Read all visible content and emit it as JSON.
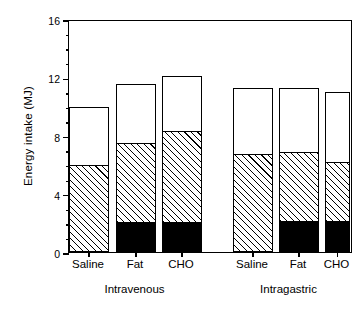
{
  "chart_data": {
    "type": "bar",
    "title": "",
    "subtitle": "",
    "xlabel": "",
    "ylabel": "Energy intake  (MJ)",
    "ylim": [
      0,
      16
    ],
    "ytick_labels": [
      "0",
      "4",
      "8",
      "12",
      "16"
    ],
    "ytick_values": [
      0,
      4,
      8,
      12,
      16
    ],
    "yminor_step": 1,
    "grid": false,
    "legend": "none",
    "stacked": true,
    "series": [
      {
        "name": "black-segment",
        "fill": "solid-black",
        "values": [
          0.0,
          2.05,
          2.05,
          0.0,
          2.1,
          2.1
        ]
      },
      {
        "name": "hatched-segment",
        "fill": "diagonal-hatch",
        "values": [
          5.98,
          5.45,
          6.25,
          6.7,
          4.75,
          4.1
        ]
      },
      {
        "name": "open-segment",
        "fill": "white",
        "values": [
          3.98,
          4.05,
          3.8,
          4.55,
          4.4,
          4.8
        ]
      }
    ],
    "cumulative_tops": {
      "black_top": [
        0.0,
        2.05,
        2.05,
        0.0,
        2.1,
        2.1
      ],
      "hatched_top": [
        5.98,
        7.5,
        8.3,
        6.7,
        6.85,
        6.2
      ],
      "bar_total": [
        9.96,
        11.55,
        12.1,
        11.25,
        11.25,
        11.0
      ]
    },
    "categories": [
      "Saline",
      "Fat",
      "CHO",
      "Saline",
      "Fat",
      "CHO"
    ],
    "groups": [
      {
        "label": "Intravenous",
        "categories": [
          "Saline",
          "Fat",
          "CHO"
        ]
      },
      {
        "label": "Intragastric",
        "categories": [
          "Saline",
          "Fat",
          "CHO"
        ]
      }
    ]
  },
  "axis": {
    "y_title": "Energy intake  (MJ)",
    "ticks": [
      {
        "label": "16",
        "value": 16,
        "major": true
      },
      {
        "label": "",
        "value": 15,
        "major": false
      },
      {
        "label": "",
        "value": 14,
        "major": false
      },
      {
        "label": "",
        "value": 13,
        "major": false
      },
      {
        "label": "12",
        "value": 12,
        "major": true
      },
      {
        "label": "",
        "value": 11,
        "major": false
      },
      {
        "label": "",
        "value": 10,
        "major": false
      },
      {
        "label": "",
        "value": 9,
        "major": false
      },
      {
        "label": "8",
        "value": 8,
        "major": true
      },
      {
        "label": "",
        "value": 7,
        "major": false
      },
      {
        "label": "",
        "value": 6,
        "major": false
      },
      {
        "label": "",
        "value": 5,
        "major": false
      },
      {
        "label": "4",
        "value": 4,
        "major": true
      },
      {
        "label": "",
        "value": 3,
        "major": false
      },
      {
        "label": "",
        "value": 2,
        "major": false
      },
      {
        "label": "",
        "value": 1,
        "major": false
      },
      {
        "label": "0",
        "value": 0,
        "major": true
      }
    ]
  },
  "bars": [
    {
      "cat": "Saline",
      "group": "Intravenous",
      "total": 9.96,
      "hatched_top": 5.98,
      "black_top": 0.0
    },
    {
      "cat": "Fat",
      "group": "Intravenous",
      "total": 11.55,
      "hatched_top": 7.5,
      "black_top": 2.05
    },
    {
      "cat": "CHO",
      "group": "Intravenous",
      "total": 12.1,
      "hatched_top": 8.3,
      "black_top": 2.05
    },
    {
      "cat": "Saline",
      "group": "Intragastric",
      "total": 11.25,
      "hatched_top": 6.7,
      "black_top": 0.0
    },
    {
      "cat": "Fat",
      "group": "Intragastric",
      "total": 11.25,
      "hatched_top": 6.85,
      "black_top": 2.1
    },
    {
      "cat": "CHO",
      "group": "Intragastric",
      "total": 11.0,
      "hatched_top": 6.2,
      "black_top": 2.1
    }
  ],
  "xlabels": {
    "cat_0": "Saline",
    "cat_1": "Fat",
    "cat_2": "CHO",
    "cat_3": "Saline",
    "cat_4": "Fat",
    "cat_5": "CHO",
    "group_0": "Intravenous",
    "group_1": "Intragastric"
  },
  "colors": {
    "axis": "#000000",
    "hatch": "#000000",
    "solid": "#000000",
    "open": "#ffffff",
    "background": "#ffffff"
  }
}
